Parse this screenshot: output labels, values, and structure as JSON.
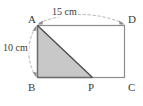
{
  "figure": {
    "kind": "geometry-diagram",
    "shape": "rectangle",
    "vertices": [
      {
        "id": "A",
        "label": "A",
        "x": 37,
        "y": 25,
        "corner": "top-left"
      },
      {
        "id": "D",
        "label": "D",
        "x": 125,
        "y": 25,
        "corner": "top-right"
      },
      {
        "id": "C",
        "label": "C",
        "x": 125,
        "y": 78,
        "corner": "bottom-right"
      },
      {
        "id": "B",
        "label": "B",
        "x": 37,
        "y": 78,
        "corner": "bottom-left"
      }
    ],
    "points": [
      {
        "id": "P",
        "label": "P",
        "x": 93,
        "y": 78,
        "on_segment": "BC"
      }
    ],
    "shaded_region": {
      "name": "triangle-ABP",
      "polygon": "37,25 37,78 93,78",
      "fill": "#c8c8c8"
    },
    "dimensions": [
      {
        "id": "top",
        "label": "15 cm",
        "value": 15,
        "unit": "cm",
        "measures": "AD",
        "style": "dashed-arc-double-arrow"
      },
      {
        "id": "left",
        "label": "10 cm",
        "value": 10,
        "unit": "cm",
        "measures": "AB",
        "style": "dashed-arc-double-arrow"
      }
    ],
    "colors": {
      "outline": "#8c8c8c",
      "hypotenuse": "#4a4a4a",
      "fill": "#c8c8c8",
      "dashed_guide": "#b4b4b4",
      "text": "#3b3b3b",
      "background": "#ffffff"
    }
  }
}
